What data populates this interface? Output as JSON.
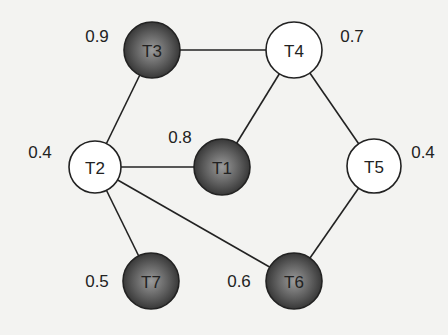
{
  "diagram": {
    "type": "graph",
    "colors": {
      "background": "#f3f3f1",
      "edge": "#222222",
      "light_node_fill": "#ffffff",
      "dark_node_fill": "#4a4a4a",
      "dark_node_highlight": "#8a8a8a"
    },
    "nodes": [
      {
        "id": "T1",
        "label": "T1",
        "weight": "0.8",
        "style": "dark",
        "x": 222,
        "y": 167,
        "r": 28,
        "wx": 180,
        "wy": 137
      },
      {
        "id": "T2",
        "label": "T2",
        "weight": "0.4",
        "style": "light",
        "x": 95,
        "y": 167,
        "r": 26,
        "wx": 40,
        "wy": 152
      },
      {
        "id": "T3",
        "label": "T3",
        "weight": "0.9",
        "style": "dark",
        "x": 152,
        "y": 50,
        "r": 28,
        "wx": 97,
        "wy": 36
      },
      {
        "id": "T4",
        "label": "T4",
        "weight": "0.7",
        "style": "light",
        "x": 294,
        "y": 50,
        "r": 28,
        "wx": 352,
        "wy": 36
      },
      {
        "id": "T5",
        "label": "T5",
        "weight": "0.4",
        "style": "light",
        "x": 374,
        "y": 166,
        "r": 27,
        "wx": 423,
        "wy": 152
      },
      {
        "id": "T6",
        "label": "T6",
        "weight": "0.6",
        "style": "dark",
        "x": 294,
        "y": 281,
        "r": 28,
        "wx": 239,
        "wy": 281
      },
      {
        "id": "T7",
        "label": "T7",
        "weight": "0.5",
        "style": "dark",
        "x": 151,
        "y": 281,
        "r": 28,
        "wx": 97,
        "wy": 281
      }
    ],
    "edges": [
      {
        "from": "T3",
        "to": "T4"
      },
      {
        "from": "T3",
        "to": "T2"
      },
      {
        "from": "T4",
        "to": "T1"
      },
      {
        "from": "T4",
        "to": "T5"
      },
      {
        "from": "T2",
        "to": "T1"
      },
      {
        "from": "T2",
        "to": "T7"
      },
      {
        "from": "T2",
        "to": "T6"
      },
      {
        "from": "T5",
        "to": "T6"
      }
    ]
  }
}
